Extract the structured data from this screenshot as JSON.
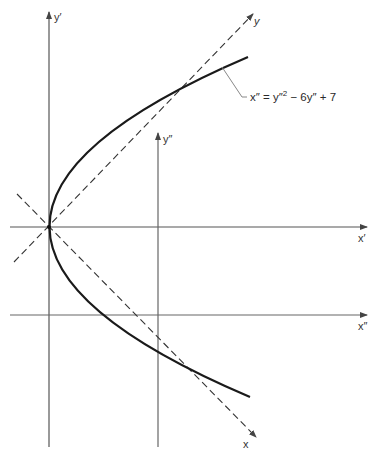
{
  "diagram": {
    "equation": "x″ = y″² − 6y″ + 7",
    "equation_parts": {
      "lhs": "x″",
      "eq": " = y″",
      "sq": "2",
      "rest": " − 6y″ + 7"
    },
    "axes": {
      "y_prime": "y′",
      "x_prime": "x′",
      "y_double_prime": "y″",
      "x_double_prime": "x″",
      "x_rotated": "x",
      "y_rotated": "y"
    },
    "colors": {
      "axis": "#555555",
      "curve": "#1a1a1a",
      "dashed": "#333333"
    }
  }
}
